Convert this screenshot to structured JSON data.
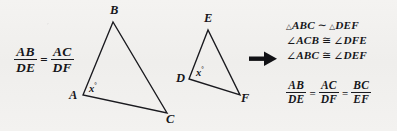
{
  "figure": {
    "stroke_color": "#1a1a1f",
    "background_color": "#f2f1ef"
  },
  "left_ratio": {
    "frac1": {
      "numerator": "AB",
      "denominator": "DE"
    },
    "equals": "=",
    "frac2": {
      "numerator": "AC",
      "denominator": "DF"
    }
  },
  "triangle_abc": {
    "name": "triangle-ABC",
    "vertices": [
      {
        "label": "A",
        "x": 83,
        "y": 95
      },
      {
        "label": "B",
        "x": 113,
        "y": 22
      },
      {
        "label": "C",
        "x": 167,
        "y": 113
      }
    ],
    "angle_label": "x",
    "angle_unit": "°",
    "angle_at": "A"
  },
  "triangle_def": {
    "name": "triangle-DEF",
    "vertices": [
      {
        "label": "D",
        "x": 189,
        "y": 79
      },
      {
        "label": "E",
        "x": 208,
        "y": 30
      },
      {
        "label": "F",
        "x": 240,
        "y": 95
      }
    ],
    "angle_label": "x",
    "angle_unit": "°",
    "angle_at": "D"
  },
  "arrow": {
    "name": "implies-arrow",
    "direction": "right"
  },
  "conclusions": [
    {
      "id": "similarity",
      "parts": [
        {
          "type": "triangle-symbol",
          "text": "△"
        },
        {
          "type": "italic",
          "text": "ABC"
        },
        {
          "type": "symbol",
          "text": "∼"
        },
        {
          "type": "triangle-symbol",
          "text": "△"
        },
        {
          "type": "italic",
          "text": "DEF"
        }
      ],
      "plain": "△ABC ∼ △DEF"
    },
    {
      "id": "angle-acb-dfe",
      "parts": [
        {
          "type": "angle-symbol",
          "text": "∠"
        },
        {
          "type": "italic",
          "text": "ACB"
        },
        {
          "type": "symbol",
          "text": "≅"
        },
        {
          "type": "angle-symbol",
          "text": "∠"
        },
        {
          "type": "italic",
          "text": "DFE"
        }
      ],
      "plain": "∠ACB ≅ ∠DFE"
    },
    {
      "id": "angle-abc-def",
      "parts": [
        {
          "type": "angle-symbol",
          "text": "∠"
        },
        {
          "type": "italic",
          "text": "ABC"
        },
        {
          "type": "symbol",
          "text": "≅"
        },
        {
          "type": "angle-symbol",
          "text": "∠"
        },
        {
          "type": "italic",
          "text": "DEF"
        }
      ],
      "plain": "∠ABC ≅ ∠DEF"
    }
  ],
  "bottom_ratio": {
    "frac1": {
      "numerator": "AB",
      "denominator": "DE"
    },
    "equals1": "=",
    "frac2": {
      "numerator": "AC",
      "denominator": "DF"
    },
    "equals2": "=",
    "frac3": {
      "numerator": "BC",
      "denominator": "EF"
    }
  }
}
